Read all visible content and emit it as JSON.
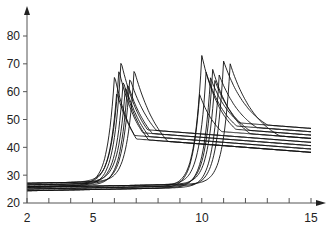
{
  "chart_data": {
    "type": "line",
    "title": "",
    "xlabel": "",
    "ylabel": "",
    "xlim": [
      2,
      15
    ],
    "ylim": [
      20,
      85
    ],
    "grid": false,
    "legend": null,
    "x_ticks": [
      2,
      3,
      4,
      5,
      6,
      7,
      8,
      9,
      10,
      11,
      12,
      13,
      14,
      15
    ],
    "x_tick_labels": [
      {
        "value": 2,
        "label": "2"
      },
      {
        "value": 5,
        "label": "5"
      },
      {
        "value": 10,
        "label": "10"
      },
      {
        "value": 15,
        "label": "15"
      }
    ],
    "y_ticks": [
      20,
      30,
      40,
      50,
      60,
      70,
      80
    ],
    "y_tick_labels": [
      "20",
      "30",
      "40",
      "50",
      "60",
      "70",
      "80"
    ],
    "series_groups": [
      {
        "name": "group-1",
        "baseline": 26.5,
        "tail_at_15": 40,
        "peaks": [
          {
            "x": 6.0,
            "y": 66
          },
          {
            "x": 6.1,
            "y": 60
          },
          {
            "x": 6.2,
            "y": 68
          },
          {
            "x": 6.3,
            "y": 71
          },
          {
            "x": 6.4,
            "y": 64
          },
          {
            "x": 6.5,
            "y": 62
          },
          {
            "x": 6.6,
            "y": 63
          },
          {
            "x": 6.7,
            "y": 65
          },
          {
            "x": 6.9,
            "y": 68
          }
        ]
      },
      {
        "name": "group-2",
        "baseline": 25,
        "tail_at_15": 45,
        "peaks": [
          {
            "x": 9.9,
            "y": 59
          },
          {
            "x": 10.0,
            "y": 73
          },
          {
            "x": 10.2,
            "y": 67
          },
          {
            "x": 10.4,
            "y": 65
          },
          {
            "x": 10.5,
            "y": 68
          },
          {
            "x": 10.6,
            "y": 64
          },
          {
            "x": 10.8,
            "y": 66
          },
          {
            "x": 11.0,
            "y": 71
          },
          {
            "x": 11.3,
            "y": 70
          }
        ]
      }
    ]
  },
  "axes": {
    "y_labels": [
      "80",
      "70",
      "60",
      "50",
      "40",
      "30",
      "20"
    ],
    "x_labels": [
      "2",
      "5",
      "10",
      "15"
    ]
  }
}
